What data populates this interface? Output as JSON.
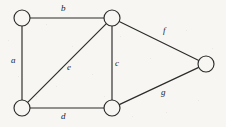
{
  "figure": {
    "background_color": "#f7f6f2",
    "ink_color": "#2b2b2b",
    "width": 226,
    "height": 127
  },
  "chart_data": {
    "type": "diagram",
    "subtype": "undirected-graph",
    "title": "",
    "xlabel": "",
    "ylabel": "",
    "grid": false,
    "legend": "none",
    "node_radius": 8,
    "nodes": [
      {
        "id": "v1",
        "name": "top-left-vertex",
        "x": 22,
        "y": 18,
        "label": ""
      },
      {
        "id": "v2",
        "name": "top-middle-vertex",
        "x": 112,
        "y": 18,
        "label": ""
      },
      {
        "id": "v3",
        "name": "right-vertex",
        "x": 206,
        "y": 64,
        "label": ""
      },
      {
        "id": "v4",
        "name": "bottom-left-vertex",
        "x": 22,
        "y": 108,
        "label": ""
      },
      {
        "id": "v5",
        "name": "bottom-middle-vertex",
        "x": 112,
        "y": 108,
        "label": ""
      }
    ],
    "edges": [
      {
        "id": "a",
        "label": "a",
        "from": "v1",
        "to": "v4",
        "label_x": 11,
        "label_y": 56
      },
      {
        "id": "b",
        "label": "b",
        "from": "v1",
        "to": "v2",
        "label_x": 61,
        "label_y": 4
      },
      {
        "id": "c",
        "label": "c",
        "from": "v2",
        "to": "v5",
        "label_x": 115,
        "label_y": 59
      },
      {
        "id": "d",
        "label": "d",
        "from": "v4",
        "to": "v5",
        "label_x": 61,
        "label_y": 112
      },
      {
        "id": "e",
        "label": "e",
        "from": "v2",
        "to": "v4",
        "label_x": 67,
        "label_y": 63
      },
      {
        "id": "f",
        "label": "f",
        "from": "v2",
        "to": "v3",
        "label_x": 163,
        "label_y": 26
      },
      {
        "id": "g",
        "label": "g",
        "from": "v5",
        "to": "v3",
        "label_x": 161,
        "label_y": 88
      }
    ],
    "node_count": 5,
    "edge_count": 7
  }
}
